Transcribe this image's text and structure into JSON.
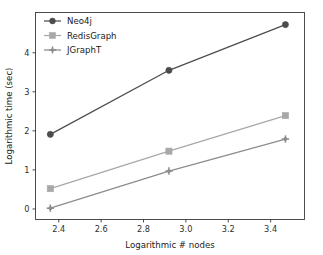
{
  "chart_data": {
    "type": "line",
    "title": "",
    "xlabel": "Logarithmic # nodes",
    "ylabel": "Logarithmic time (sec)",
    "x": [
      2.36,
      2.92,
      3.47
    ],
    "xlim": [
      2.29,
      3.56
    ],
    "ylim": [
      -0.27,
      5.03
    ],
    "xticks": [
      2.4,
      2.6,
      2.8,
      3.0,
      3.2,
      3.4
    ],
    "xticklabels": [
      "2.4",
      "2.6",
      "2.8",
      "3.0",
      "3.2",
      "3.4"
    ],
    "yticks": [
      0,
      1,
      2,
      3,
      4
    ],
    "yticklabels": [
      "0",
      "1",
      "2",
      "3",
      "4"
    ],
    "grid": false,
    "legend_position": "upper left",
    "series": [
      {
        "name": "Neo4j",
        "values": [
          1.91,
          3.55,
          4.72
        ],
        "color": "#4c4c4c",
        "marker": "circle"
      },
      {
        "name": "RedisGraph",
        "values": [
          0.52,
          1.48,
          2.39
        ],
        "color": "#a8a8a8",
        "marker": "square"
      },
      {
        "name": "JGraphT",
        "values": [
          0.02,
          0.97,
          1.79
        ],
        "color": "#8c8c8c",
        "marker": "plus"
      }
    ]
  },
  "figure": {
    "background_color": "#ffffff",
    "axis_color": "#3a3a3a",
    "text_color": "#1a1a1a"
  }
}
